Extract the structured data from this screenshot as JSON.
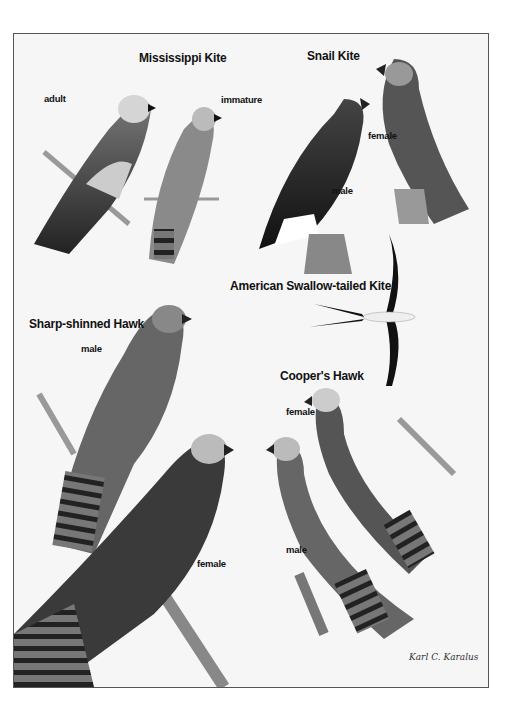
{
  "plate": {
    "species": [
      {
        "name": "Mississippi Kite",
        "labels": [
          "adult",
          "immature"
        ]
      },
      {
        "name": "Snail Kite",
        "labels": [
          "female",
          "male"
        ]
      },
      {
        "name": "American Swallow-tailed Kite",
        "labels": []
      },
      {
        "name": "Sharp-shinned Hawk",
        "labels": [
          "male",
          "female"
        ]
      },
      {
        "name": "Cooper's Hawk",
        "labels": [
          "female",
          "male"
        ]
      }
    ],
    "signature": "Karl C. Karalus"
  },
  "colors": {
    "background": "#f6f6f6",
    "frame": "#555555",
    "ink": "#111111"
  }
}
